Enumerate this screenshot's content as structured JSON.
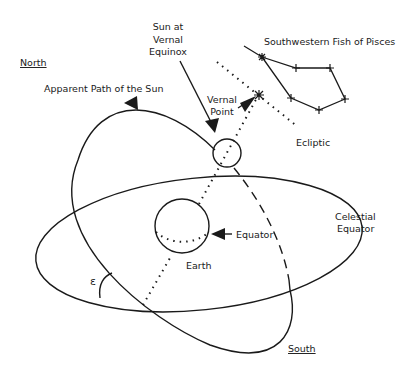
{
  "labels": {
    "north": "North",
    "south": "South",
    "apparent_path": "Apparent Path of the Sun",
    "sun_line1": "Sun at",
    "sun_line2": "Vernal",
    "sun_line3": "Equinox",
    "vernal_line1": "Vernal",
    "vernal_line2": "Point",
    "pisces": "Southwestern Fish of Pisces",
    "ecliptic": "Ecliptic",
    "celestial_line1": "Celestial",
    "celestial_line2": "Equator",
    "equator": "Equator",
    "earth": "Earth",
    "epsilon": "ε"
  },
  "colors": {
    "stroke": "#1a1a1a",
    "background": "#ffffff"
  }
}
